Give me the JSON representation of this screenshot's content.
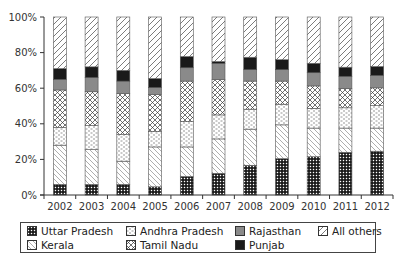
{
  "chart_data": {
    "type": "bar",
    "stacked": true,
    "normalized": true,
    "title": "",
    "xlabel": "",
    "ylabel": "",
    "ylim": [
      0,
      100
    ],
    "yticks": [
      "0%",
      "20%",
      "40%",
      "60%",
      "80%",
      "100%"
    ],
    "grid": false,
    "legend_position": "bottom",
    "categories": [
      "2002",
      "2003",
      "2004",
      "2005",
      "2006",
      "2007",
      "2008",
      "2009",
      "2010",
      "2011",
      "2012"
    ],
    "series": [
      {
        "name": "Uttar Pradesh",
        "pattern": "grid-dense",
        "values": [
          6,
          6,
          6,
          4.6,
          10.4,
          12.2,
          16.7,
          20.4,
          21.5,
          24,
          24.6
        ]
      },
      {
        "name": "Kerala",
        "pattern": "backslash-light",
        "values": [
          22,
          19.5,
          13,
          22.4,
          16.6,
          19.3,
          20.3,
          19,
          16.1,
          13.6,
          13
        ]
      },
      {
        "name": "Andhra Pradesh",
        "pattern": "dashes",
        "values": [
          10,
          13.5,
          15,
          8.7,
          14.3,
          13.5,
          11.2,
          11.6,
          11.1,
          11.4,
          12.6
        ]
      },
      {
        "name": "Tamil Nadu",
        "pattern": "crosshatch",
        "values": [
          21,
          19,
          23,
          20.8,
          22.7,
          19.8,
          15.8,
          13,
          12.6,
          10.8,
          10
        ]
      },
      {
        "name": "Rajasthan",
        "pattern": "solid-gray",
        "values": [
          6,
          8,
          7,
          3.9,
          7.5,
          9.2,
          6.4,
          6.4,
          7.4,
          6.9,
          7
        ]
      },
      {
        "name": "Punjab",
        "pattern": "solid-black",
        "values": [
          6,
          6,
          6,
          5,
          6.3,
          1,
          7,
          5.6,
          5.3,
          5.1,
          5
        ]
      },
      {
        "name": "All others",
        "pattern": "slash",
        "values": [
          29,
          28,
          30,
          34.6,
          22.2,
          25,
          22.6,
          24,
          26,
          28.2,
          27.8
        ]
      }
    ]
  },
  "legend": {
    "items": [
      {
        "label": "Uttar Pradesh"
      },
      {
        "label": "Kerala"
      },
      {
        "label": "Andhra Pradesh"
      },
      {
        "label": "Tamil Nadu"
      },
      {
        "label": "Rajasthan"
      },
      {
        "label": "Punjab"
      },
      {
        "label": "All others"
      }
    ]
  },
  "colors": {
    "axis": "#333333",
    "gray_fill": "#8a8a8a",
    "black_fill": "#1a1a1a",
    "outline": "#555555"
  }
}
